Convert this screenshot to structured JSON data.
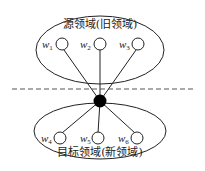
{
  "diagram": {
    "source_domain": {
      "label": "源领域(旧领域)",
      "nodes": [
        {
          "label": "w",
          "sub": "1"
        },
        {
          "label": "w",
          "sub": "2"
        },
        {
          "label": "w",
          "sub": "3"
        }
      ]
    },
    "target_domain": {
      "label": "目标领域(新领域)",
      "nodes": [
        {
          "label": "w",
          "sub": "4"
        },
        {
          "label": "w",
          "sub": "5"
        },
        {
          "label": "w",
          "sub": "6"
        }
      ]
    },
    "colors": {
      "stroke": "#222222",
      "hub": "#000000",
      "dash": "#555555"
    }
  }
}
